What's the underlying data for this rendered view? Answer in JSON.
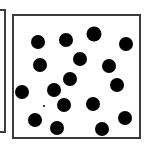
{
  "figure": {
    "background_color": "#ffffff",
    "panel": {
      "border_color": "#3b3b3b",
      "border_width_px": 2,
      "fill_color": "#ffffff",
      "x": 12,
      "y": 14,
      "width": 129,
      "height": 125
    },
    "neighbor_panel_sliver": {
      "border_color": "#3d3d3d",
      "border_width_px": 2,
      "fill_color": "#ffffff",
      "x": -6,
      "y": 9,
      "width": 12,
      "height": 124
    }
  },
  "chart_data": {
    "type": "scatter",
    "xlabel": "",
    "ylabel": "",
    "xlim": [
      0,
      129
    ],
    "ylim": [
      0,
      125
    ],
    "grid": false,
    "legend": false,
    "marker": {
      "shape": "circle",
      "color": "#000000",
      "diameter_px": 14
    },
    "count": 18,
    "points": [
      {
        "x": 24,
        "y": 26,
        "d": 14
      },
      {
        "x": 52,
        "y": 24,
        "d": 14
      },
      {
        "x": 80,
        "y": 18,
        "d": 15
      },
      {
        "x": 112,
        "y": 28,
        "d": 14
      },
      {
        "x": 66,
        "y": 43,
        "d": 14
      },
      {
        "x": 26,
        "y": 49,
        "d": 14
      },
      {
        "x": 95,
        "y": 50,
        "d": 14
      },
      {
        "x": 56,
        "y": 63,
        "d": 14
      },
      {
        "x": 103,
        "y": 69,
        "d": 14
      },
      {
        "x": 8,
        "y": 76,
        "d": 14
      },
      {
        "x": 40,
        "y": 74,
        "d": 14
      },
      {
        "x": 50,
        "y": 89,
        "d": 14
      },
      {
        "x": 79,
        "y": 88,
        "d": 14
      },
      {
        "x": 21,
        "y": 104,
        "d": 14
      },
      {
        "x": 43,
        "y": 112,
        "d": 14
      },
      {
        "x": 88,
        "y": 113,
        "d": 14
      },
      {
        "x": 111,
        "y": 102,
        "d": 14
      },
      {
        "x": 30,
        "y": 90,
        "d": 2
      }
    ]
  }
}
